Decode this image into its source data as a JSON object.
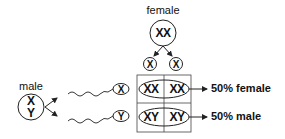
{
  "diagram": {
    "type": "punnett-square-sex-determination",
    "female": {
      "label": "female",
      "genotype": "XX",
      "gametes": [
        "X",
        "X"
      ]
    },
    "male": {
      "label": "male",
      "genotype_line1": "X",
      "genotype_line2": "Y",
      "gametes": [
        "X",
        "Y"
      ]
    },
    "punnett": {
      "cells": [
        [
          "XX",
          "XX"
        ],
        [
          "XY",
          "XY"
        ]
      ]
    },
    "results": [
      {
        "label": "50% female"
      },
      {
        "label": "50% male"
      }
    ],
    "colors": {
      "stroke": "#222222",
      "text": "#111111",
      "background": "#ffffff"
    }
  }
}
